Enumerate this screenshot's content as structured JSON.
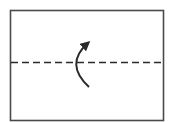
{
  "diagram": {
    "kind": "fold-instruction",
    "elements": [
      {
        "id": "paper",
        "type": "rectangle",
        "description": "sheet of paper outline"
      },
      {
        "id": "fold-line",
        "type": "dashed-line",
        "orientation": "horizontal",
        "description": "valley fold line across the middle"
      },
      {
        "id": "fold-arrow",
        "type": "curved-arrow",
        "direction": "up",
        "description": "arrow indicating folding bottom half up"
      }
    ],
    "colors": {
      "stroke": "#2a2a2a",
      "background": "#ffffff"
    }
  }
}
